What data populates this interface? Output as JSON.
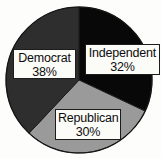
{
  "chart_data": {
    "type": "pie",
    "title": "",
    "xlabel": "",
    "ylabel": "",
    "categories": [
      "Democrat",
      "Independent",
      "Republican"
    ],
    "values": [
      38,
      32,
      30
    ],
    "units": "percent",
    "legend": "none",
    "grid": false,
    "data_labels": [
      "38%",
      "32%",
      "30%"
    ],
    "slices": [
      {
        "label": "Democrat",
        "value": 38,
        "value_text": "38%",
        "color": "#2e2e2e",
        "start_angle_deg": 0,
        "end_angle_deg": 136.8
      },
      {
        "label": "Independent",
        "value": 32,
        "value_text": "32%",
        "color": "#080808",
        "start_angle_deg": 244.8,
        "end_angle_deg": 360
      },
      {
        "label": "Republican",
        "value": 30,
        "value_text": "30%",
        "color": "#9a9a9a",
        "start_angle_deg": 136.8,
        "end_angle_deg": 244.8
      }
    ]
  },
  "colors": {
    "background": "#fdfdfb",
    "democrat": "#2e2e2e",
    "independent": "#080808",
    "republican": "#9a9a9a",
    "label_fill": "#fbfbf8",
    "label_border": "#1c1c1c",
    "label_text": "#0d0d0d",
    "pie_outline": "#1a1a1a"
  },
  "labels": {
    "democrat": {
      "name": "Democrat",
      "percent": "38%"
    },
    "independent": {
      "name": "Independent",
      "percent": "32%"
    },
    "republican": {
      "name": "Republican",
      "percent": "30%"
    }
  }
}
